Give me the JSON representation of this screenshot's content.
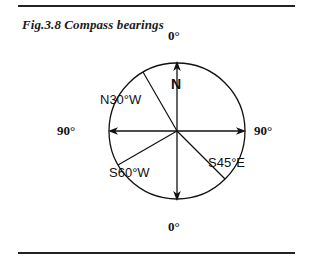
{
  "figure": {
    "caption": "Fig.3.8 Compass bearings",
    "rules": {
      "top_divider": "horizontal-rule",
      "bottom_divider": "horizontal-rule"
    },
    "diagram": {
      "type": "compass-bearing-diagram",
      "circle": {
        "center_x": 177,
        "center_y": 131,
        "radius": 68
      },
      "axis_labels": {
        "top": "0°",
        "bottom": "0°",
        "left": "90°",
        "right": "90°",
        "north": "N"
      },
      "bearings": [
        {
          "label": "N30°W",
          "from": "N",
          "angle_deg": 30,
          "toward": "W"
        },
        {
          "label": "S60°W",
          "from": "S",
          "angle_deg": 60,
          "toward": "W"
        },
        {
          "label": "S45°E",
          "from": "S",
          "angle_deg": 45,
          "toward": "E"
        }
      ],
      "arrows": [
        "arrow-up-north",
        "arrow-down-south",
        "arrow-left-west",
        "arrow-right-east"
      ],
      "colors": {
        "ink": "#111111",
        "rule": "#222222",
        "background": "#ffffff"
      }
    }
  }
}
